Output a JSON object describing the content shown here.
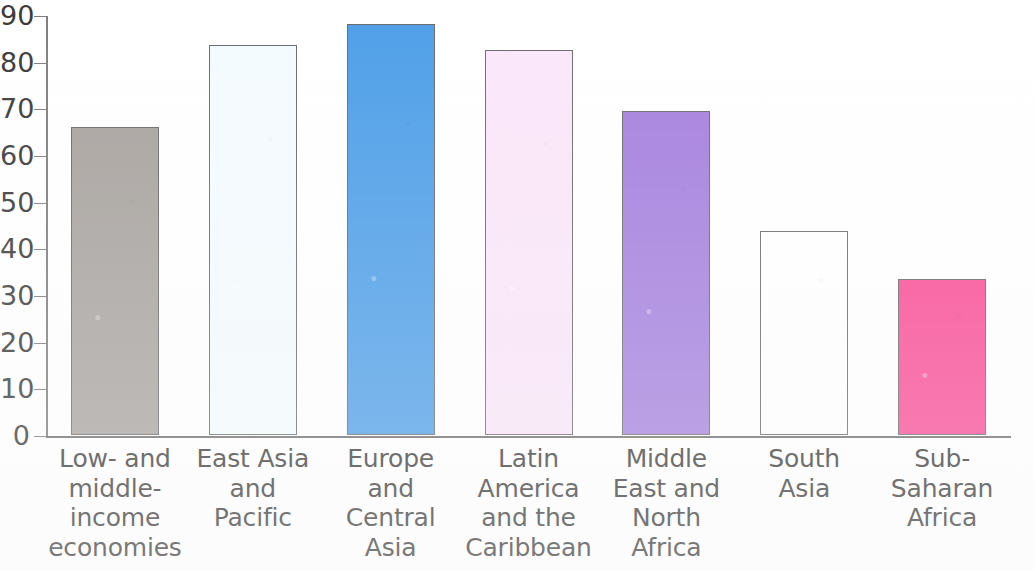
{
  "chart_data": {
    "type": "bar",
    "title": "",
    "subtitle": "",
    "xlabel": "",
    "ylabel": "",
    "ylim": [
      0,
      90
    ],
    "ytick_step": 10,
    "yticks": [
      "90",
      "80",
      "70",
      "60",
      "50",
      "40",
      "30",
      "20",
      "10",
      "0"
    ],
    "grid": false,
    "legend": "none",
    "categories": [
      "Low- and\nmiddle-\nincome\neconomies",
      "East Asia\nand\nPacific",
      "Europe\nand\nCentral\nAsia",
      "Latin\nAmerica\nand the\nCaribbean",
      "Middle\nEast and\nNorth\nAfrica",
      "South\nAsia",
      "Sub-\nSaharan\nAfrica"
    ],
    "values": [
      66,
      83.5,
      88,
      82.5,
      69.5,
      43.8,
      33.5
    ],
    "bar_colors": [
      "#a8a39f",
      "#f4fbfe",
      "#4f9fe8",
      "#fae6f9",
      "#a581de",
      "#ffffff",
      "#f94d96"
    ],
    "bar_edge_color": "#6a6a6a",
    "axis_color": "#7e7e7e"
  },
  "axis": {
    "y_ticks": [
      {
        "label": "90",
        "value": 90
      },
      {
        "label": "80",
        "value": 80
      },
      {
        "label": "70",
        "value": 70
      },
      {
        "label": "60",
        "value": 60
      },
      {
        "label": "50",
        "value": 50
      },
      {
        "label": "40",
        "value": 40
      },
      {
        "label": "30",
        "value": 30
      },
      {
        "label": "20",
        "value": 20
      },
      {
        "label": "10",
        "value": 10
      },
      {
        "label": "0",
        "value": 0
      }
    ]
  },
  "bars": [
    {
      "label": "Low- and\nmiddle-\nincome\neconomies",
      "value": 66,
      "color": "#a8a39f"
    },
    {
      "label": "East Asia\nand\nPacific",
      "value": 83.5,
      "color": "#f4fbfe"
    },
    {
      "label": "Europe\nand\nCentral\nAsia",
      "value": 88,
      "color": "#4f9fe8"
    },
    {
      "label": "Latin\nAmerica\nand the\nCaribbean",
      "value": 82.5,
      "color": "#fae6f9"
    },
    {
      "label": "Middle\nEast and\nNorth\nAfrica",
      "value": 69.5,
      "color": "#a581de"
    },
    {
      "label": "South\nAsia",
      "value": 43.8,
      "color": "#ffffff"
    },
    {
      "label": "Sub-\nSaharan\nAfrica",
      "value": 33.5,
      "color": "#f94d96"
    }
  ]
}
